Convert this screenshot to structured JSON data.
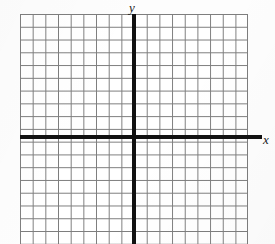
{
  "figure": {
    "kind": "blank-cartesian-coordinate-grid",
    "background_color": "#fdfdfd",
    "plot_background_color": "#ffffff"
  },
  "axes": {
    "x": {
      "label": "x",
      "color": "#111111",
      "line_thickness_px": 4,
      "orientation": "horizontal"
    },
    "y": {
      "label": "y",
      "color": "#111111",
      "line_thickness_px": 4,
      "orientation": "vertical"
    }
  },
  "grid": {
    "color": "#7d7d7d",
    "cell_width_px": 12.68,
    "cell_height_px": 12.78,
    "columns": 18,
    "rows": 18,
    "show_tick_numbers": false,
    "origin_x_px": 134,
    "origin_y_px": 137
  },
  "chart_data": {
    "type": "scatter",
    "title": "",
    "subtitle": "",
    "xlabel": "x",
    "ylabel": "y",
    "x": [],
    "y": [],
    "series": [],
    "annotations": [],
    "tick_labels_x": [],
    "tick_labels_y": [],
    "xlim": [
      -9,
      9
    ],
    "ylim": [
      -8.4,
      9.6
    ],
    "grid": true,
    "legend": false,
    "legend_position": "none",
    "note": "Empty coordinate plane: grid with darkened x and y axes, italic axis letters, no plotted data, no numeric tick labels."
  }
}
